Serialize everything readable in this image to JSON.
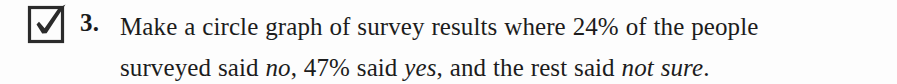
{
  "exercise": {
    "checkbox": {
      "icon": "checked-checkbox-icon",
      "state": "checked",
      "stroke_color": "#2b2b2b"
    },
    "number": "3.",
    "line1": {
      "part1": "Make a circle graph of survey results where 24% of the people"
    },
    "line2": {
      "part1": "surveyed said ",
      "italic1": "no",
      "part2": ", 47% said ",
      "italic2": "yes",
      "part3": ", and the rest said ",
      "italic3": "not sure",
      "part4": "."
    },
    "values": {
      "percent_no": "24%",
      "percent_yes": "47%",
      "category_no": "no",
      "category_yes": "yes",
      "category_rest": "not sure"
    },
    "colors": {
      "background": "#fdfdfd",
      "text": "#1c1c1c",
      "number": "#1a1a1a"
    }
  }
}
